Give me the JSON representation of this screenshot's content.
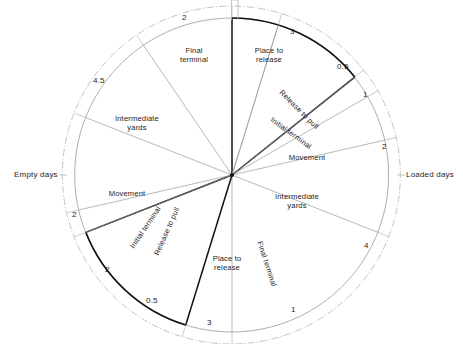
{
  "figure": {
    "type": "circular-cycle-diagram",
    "center": {
      "x": 232,
      "y": 175
    },
    "radius_inner": 157,
    "radius_outer": 169,
    "side_labels": {
      "left": "Empty days",
      "right": "Loaded days"
    }
  },
  "chart_data": {
    "type": "pie",
    "title": "",
    "subtitle": "",
    "xlabel": "",
    "ylabel": "",
    "units": "days",
    "total": 21,
    "halves": [
      {
        "name": "Loaded days",
        "side": "right",
        "total": 10.5
      },
      {
        "name": "Empty days",
        "side": "left",
        "total": 10.5
      }
    ],
    "categories": [
      "Place to release",
      "Release to pull",
      "Initial terminal",
      "Movement",
      "Intermediate yards",
      "Final terminal"
    ],
    "series": [
      {
        "name": "Loaded days",
        "labels": [
          "Place to release",
          "Release to pull",
          "Initial terminal",
          "Movement",
          "Intermediate yards",
          "Final terminal"
        ],
        "values": [
          3,
          0.5,
          1,
          2,
          4,
          1
        ]
      },
      {
        "name": "Empty days",
        "labels": [
          "Place to release",
          "Release to pull",
          "Initial terminal",
          "Movement",
          "Intermediate yards",
          "Final terminal"
        ],
        "values": [
          3,
          0.5,
          2,
          2,
          4.5,
          2
        ]
      }
    ],
    "segments": [
      {
        "id": "loaded-place-to-release",
        "half": "Loaded days",
        "label": "Place to release",
        "value": 3,
        "value_text": "3",
        "a0": 0,
        "a1": 51.43,
        "emph": true
      },
      {
        "id": "loaded-release-to-pull",
        "half": "Loaded days",
        "label": "Release to pull",
        "value": 0.5,
        "value_text": "0.5",
        "a0": 51.43,
        "a1": 60.0,
        "emph": false
      },
      {
        "id": "loaded-initial-terminal",
        "half": "Loaded days",
        "label": "Initial terminal",
        "value": 1,
        "value_text": "1",
        "a0": 60.0,
        "a1": 77.14,
        "emph": false
      },
      {
        "id": "loaded-movement",
        "half": "Loaded days",
        "label": "Movement",
        "value": 2,
        "value_text": "2",
        "a0": 77.14,
        "a1": 111.43,
        "emph": false
      },
      {
        "id": "loaded-intermediate-yards",
        "half": "Loaded days",
        "label": "Intermediate yards",
        "value": 4,
        "value_text": "4",
        "a0": 111.43,
        "a1": 180.0,
        "emph": false
      },
      {
        "id": "loaded-final-terminal",
        "half": "Loaded days",
        "label": "Final terminal",
        "value": 1,
        "value_text": "1",
        "a0": 180.0,
        "a1": 197.14,
        "emph": false
      },
      {
        "id": "empty-place-to-release",
        "half": "Empty days",
        "label": "Place to release",
        "value": 3,
        "value_text": "3",
        "a0": 197.14,
        "a1": 248.57,
        "emph": true
      },
      {
        "id": "empty-release-to-pull",
        "half": "Empty days",
        "label": "Release to pull",
        "value": 0.5,
        "value_text": "0.5",
        "a0": 248.57,
        "a1": 257.14,
        "emph": false
      },
      {
        "id": "empty-initial-terminal",
        "half": "Empty days",
        "label": "Initial terminal",
        "value": 2,
        "value_text": "2",
        "a0": 257.14,
        "a1": 291.43,
        "emph": false
      },
      {
        "id": "empty-movement",
        "half": "Empty days",
        "label": "Movement",
        "value": 2,
        "value_text": "2",
        "a0": 291.43,
        "a1": 325.71,
        "emph": false
      },
      {
        "id": "empty-intermediate-yards",
        "half": "Empty days",
        "label": "Intermediate yards",
        "value": 4.5,
        "value_text": "4.5",
        "a0": 325.71,
        "a1": 0.0,
        "emph": false
      },
      {
        "id": "empty-final-terminal",
        "half": "Empty days",
        "label": "Final terminal",
        "value": 2,
        "value_text": "2",
        "a0": 17.14,
        "a1": 0.0,
        "emph": false
      }
    ],
    "legend_position": "none",
    "grid": false
  },
  "labels": {
    "top_final_terminal": "Final\nterminal",
    "top_place_to_release": "Place to\nrelease",
    "right_release_to_pull": "Release to pull",
    "right_initial_terminal": "Initial terminal",
    "right_movement": "Movement",
    "right_intermediate_yards": "Intermediate\nyards",
    "bottom_final_terminal": "Final terminal",
    "bottom_place_to_release": "Place to\nrelease",
    "bottom_release_to_pull": "Release to pull",
    "left_initial_terminal": "Initial terminal",
    "left_movement": "Movement",
    "left_intermediate_yards": "Intermediate\nyards"
  },
  "ticks": {
    "t_top_left": "2",
    "t_top_right": "3",
    "t_right_half": "0.5",
    "t_right_one": "1",
    "t_right_two": "2",
    "t_right_four": "4",
    "t_bottom_right_one": "1",
    "t_bottom_three": "3",
    "t_bottom_left_half": "0.5",
    "t_left_lower_two": "2",
    "t_left_two": "2",
    "t_left_fourfive": "4.5"
  },
  "colors": {
    "stroke_light": "#9a9a9a",
    "stroke_dark": "#111111",
    "ring": "#b4b4b4",
    "text": "#1c1c1c",
    "background": "#ffffff"
  }
}
